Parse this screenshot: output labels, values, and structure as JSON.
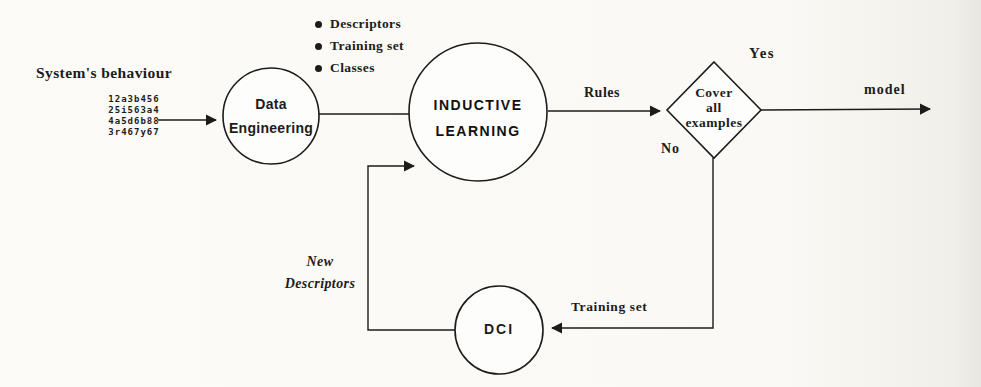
{
  "diagram": {
    "source": {
      "label": "System's behaviour",
      "data_sample_lines": [
        "12a3b456",
        "25i563a4",
        "4a5d6b88",
        "3r467y67"
      ]
    },
    "bullets": [
      "Descriptors",
      "Training set",
      "Classes"
    ],
    "nodes": {
      "data_engineering": {
        "line1": "Data",
        "line2": "Engineering"
      },
      "inductive_learning": {
        "line1": "INDUCTIVE",
        "line2": "LEARNING"
      },
      "decision": {
        "line1": "Cover",
        "line2": "all",
        "line3": "examples"
      },
      "dci": {
        "label": "DCI"
      }
    },
    "edge_labels": {
      "rules": "Rules",
      "yes": "Yes",
      "no": "No",
      "model": "model",
      "training_set": "Training set",
      "new_descriptors_line1": "New",
      "new_descriptors_line2": "Descriptors"
    },
    "colors": {
      "ink": "#1c1c1c",
      "paper": "#fbfaf7",
      "stipple_bg": "#eceae3"
    }
  }
}
